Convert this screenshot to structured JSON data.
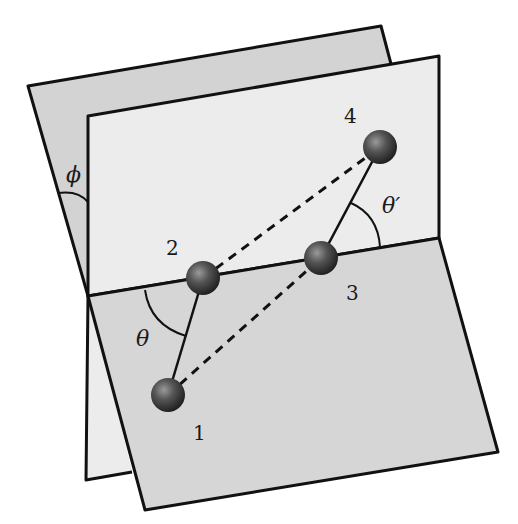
{
  "diagram": {
    "type": "dihedral-angle-illustration",
    "atoms": [
      {
        "id": "1",
        "label": "1",
        "x": 168,
        "y": 395
      },
      {
        "id": "2",
        "label": "2",
        "x": 203,
        "y": 278
      },
      {
        "id": "3",
        "label": "3",
        "x": 321,
        "y": 258
      },
      {
        "id": "4",
        "label": "4",
        "x": 380,
        "y": 147
      }
    ],
    "bonds_solid": [
      [
        "1",
        "2"
      ],
      [
        "3",
        "4"
      ]
    ],
    "bonds_dashed": [
      [
        "2",
        "4"
      ],
      [
        "1",
        "3"
      ]
    ],
    "angles": {
      "phi": "ϕ",
      "theta": "θ",
      "theta_prime": "θ′"
    },
    "colors": {
      "back_plane": "#d3d3d3",
      "upright_plane": "#ececec",
      "lower_plane": "#d6d6d6",
      "outline": "#111111",
      "atom": "#3a3a3a"
    }
  }
}
